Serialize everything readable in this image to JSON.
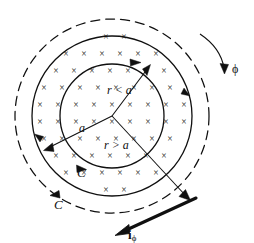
{
  "figure": {
    "background_color": "#ffffff",
    "line_color": "#101010",
    "width": 254,
    "height": 243
  },
  "labels": {
    "r_less_than_a": "r < a",
    "r_greater_than_a": "r > a",
    "radius_a": "a",
    "contour_inner": "C",
    "contour_outer": "C",
    "phi_direction": "ϕ",
    "surface_current": "i",
    "surface_current_subscript": "ϕ"
  },
  "field_marks": {
    "glyph": "×",
    "meaning": "field-into-page",
    "rows": [
      {
        "y": 40,
        "xs": [
          88,
          106,
          124,
          142
        ]
      },
      {
        "y": 57,
        "xs": [
          66,
          84,
          102,
          120,
          138,
          156,
          174
        ]
      },
      {
        "y": 74,
        "xs": [
          56,
          74,
          92,
          110,
          128,
          146,
          164,
          182
        ]
      },
      {
        "y": 91,
        "xs": [
          44,
          62,
          80,
          98,
          116,
          134,
          152,
          170,
          188
        ]
      },
      {
        "y": 108,
        "xs": [
          40,
          58,
          76,
          94,
          112,
          130,
          148,
          166,
          184
        ]
      },
      {
        "y": 125,
        "xs": [
          40,
          58,
          76,
          94,
          112,
          130,
          148,
          166,
          184
        ]
      },
      {
        "y": 142,
        "xs": [
          44,
          62,
          80,
          98,
          116,
          134,
          152,
          170,
          188
        ]
      },
      {
        "y": 159,
        "xs": [
          56,
          74,
          92,
          110,
          128,
          146,
          164,
          182
        ]
      },
      {
        "y": 176,
        "xs": [
          66,
          84,
          102,
          120,
          138,
          156,
          174
        ]
      },
      {
        "y": 193,
        "xs": [
          88,
          106,
          124,
          142
        ]
      }
    ]
  },
  "geometry": {
    "center": {
      "x": 112,
      "y": 116
    },
    "circle_outer_dashed_radius": 97,
    "circle_solid_radius": 80,
    "circle_inner_contour_radius": 52
  }
}
